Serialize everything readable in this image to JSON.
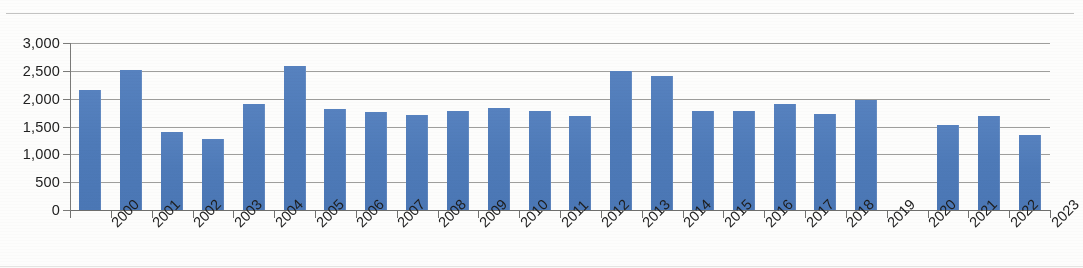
{
  "chart_data": {
    "type": "bar",
    "title": "",
    "xlabel": "",
    "ylabel": "",
    "ylim": [
      0,
      3000
    ],
    "ytick_step": 500,
    "ytick_labels": [
      "3,000",
      "2,500",
      "2,000",
      "1,500",
      "1,000",
      "500",
      "0"
    ],
    "ytick_values": [
      3000,
      2500,
      2000,
      1500,
      1000,
      500,
      0
    ],
    "grid": "horizontal",
    "legend": "none",
    "bar_color": "#4F7CBA",
    "gridline_color": "#8D8D8B",
    "axis_color": "#6F6F6D",
    "label_rotation_deg": -45,
    "categories": [
      "2000",
      "2001",
      "2002",
      "2003",
      "2004",
      "2005",
      "2006",
      "2007",
      "2008",
      "2009",
      "2010",
      "2011",
      "2012",
      "2013",
      "2014",
      "2015",
      "2016",
      "2017",
      "2018",
      "2019",
      "2020",
      "2021",
      "2022",
      "2023"
    ],
    "values": [
      2150,
      2520,
      1400,
      1270,
      1900,
      2580,
      1810,
      1760,
      1700,
      1770,
      1830,
      1770,
      1680,
      2490,
      2400,
      1780,
      1780,
      1900,
      1730,
      1980,
      0,
      1520,
      1680,
      1340
    ]
  }
}
